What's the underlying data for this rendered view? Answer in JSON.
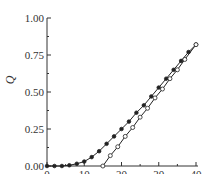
{
  "chart_data": {
    "type": "line",
    "title": "",
    "xlabel": "t",
    "ylabel": "Q",
    "xlim": [
      0,
      40
    ],
    "ylim": [
      0,
      1
    ],
    "xticks": [
      "0",
      "10",
      "20",
      "30",
      "40"
    ],
    "yticks": [
      "0.00",
      "0.25",
      "0.50",
      "0.75",
      "1.00"
    ],
    "grid": false,
    "legend": null,
    "series": [
      {
        "name": "filled markers",
        "marker": "filled-circle",
        "x": [
          0,
          2,
          4,
          6,
          8,
          10,
          12,
          14,
          16,
          18,
          20,
          22,
          24,
          26,
          28,
          30,
          32,
          34,
          36,
          38,
          40
        ],
        "y": [
          0.0,
          0.0,
          0.0,
          0.005,
          0.015,
          0.03,
          0.06,
          0.1,
          0.15,
          0.2,
          0.25,
          0.3,
          0.36,
          0.41,
          0.47,
          0.53,
          0.59,
          0.65,
          0.71,
          0.77,
          0.82
        ]
      },
      {
        "name": "open markers",
        "marker": "open-circle",
        "x": [
          15,
          17,
          19,
          21,
          23,
          25,
          27,
          29,
          31,
          33,
          35,
          37,
          40
        ],
        "y": [
          0.0,
          0.07,
          0.13,
          0.2,
          0.26,
          0.33,
          0.39,
          0.46,
          0.52,
          0.59,
          0.65,
          0.72,
          0.82
        ]
      }
    ]
  }
}
